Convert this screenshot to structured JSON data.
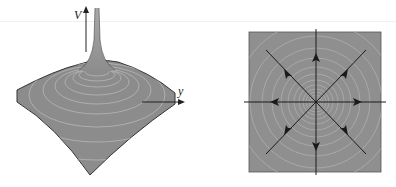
{
  "figure": {
    "left_panel": {
      "type": "3d-potential-surface",
      "axis_labels": {
        "vertical": "V",
        "horizontal": "y"
      },
      "colors": {
        "surface": "#8c8c8c",
        "contours": "#b8b8b8",
        "edge": "#333333"
      }
    },
    "right_panel": {
      "type": "radial-vector-field",
      "arrow_directions": [
        "up",
        "down",
        "left",
        "right",
        "up-left",
        "up-right",
        "down-left",
        "down-right"
      ],
      "colors": {
        "background": "#8f8f8f",
        "contours": "#b3b3b3",
        "lines": "#1a1a1a"
      }
    }
  }
}
